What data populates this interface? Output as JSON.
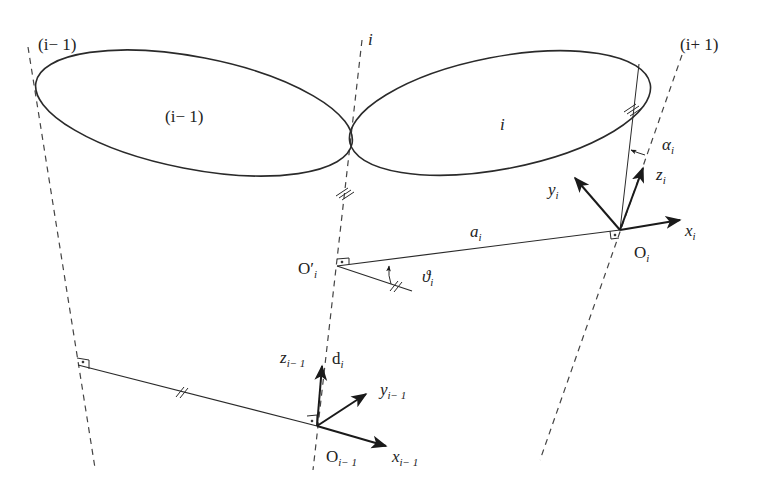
{
  "diagram": {
    "type": "Denavit-Hartenberg link frame diagram",
    "axes": [
      {
        "id": "axis_i_minus_1",
        "label": "(i− 1)"
      },
      {
        "id": "axis_i",
        "label": "i"
      },
      {
        "id": "axis_i_plus_1",
        "label": "(i+ 1)"
      }
    ],
    "links": [
      {
        "id": "link_i_minus_1",
        "label": "(i− 1)"
      },
      {
        "id": "link_i",
        "label": "i"
      }
    ],
    "frames": {
      "frame_i": {
        "origin": "O",
        "origin_sub": "i",
        "x": "x",
        "x_sub": "i",
        "y": "y",
        "y_sub": "i",
        "z": "z",
        "z_sub": "i"
      },
      "frame_i_minus_1": {
        "origin": "O",
        "origin_sub": "i− 1",
        "x": "x",
        "x_sub": "i− 1",
        "y": "y",
        "y_sub": "i− 1",
        "z": "z",
        "z_sub": "i− 1"
      },
      "intermediate": {
        "origin": "O′",
        "origin_sub": "i"
      }
    },
    "parameters": {
      "a": {
        "sym": "a",
        "sub": "i"
      },
      "d": {
        "sym": "d",
        "sub": "i"
      },
      "alpha": {
        "sym": "α",
        "sub": "i"
      },
      "theta": {
        "sym": "ϑ",
        "sub": "i"
      }
    },
    "colors": {
      "line": "#2a2a2a",
      "dashed": "#444444",
      "background": "#ffffff"
    }
  }
}
